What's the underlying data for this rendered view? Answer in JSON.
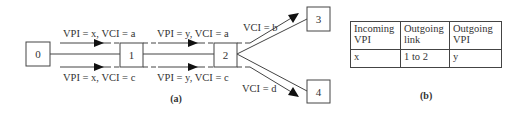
{
  "figure_a": {
    "caption": "(a)",
    "nodes": [
      {
        "id": "0",
        "label": "0"
      },
      {
        "id": "1",
        "label": "1"
      },
      {
        "id": "2",
        "label": "2"
      },
      {
        "id": "3",
        "label": "3"
      },
      {
        "id": "4",
        "label": "4"
      }
    ],
    "labels": {
      "link01_top": "VPI = x, VCI = a",
      "link01_bottom": "VPI = x, VCI = c",
      "link12_top": "VPI = y, VCI = a",
      "link12_bottom": "VPI = y, VCI = c",
      "link23": "VCI = b",
      "link24": "VCI = d"
    }
  },
  "figure_b": {
    "caption": "(b)",
    "table": {
      "headers": [
        [
          "Incoming",
          "VPI"
        ],
        [
          "Outgoing",
          "link"
        ],
        [
          "Outgoing",
          "VPI"
        ]
      ],
      "rows": [
        [
          "x",
          "1 to 2",
          "y"
        ]
      ]
    }
  }
}
